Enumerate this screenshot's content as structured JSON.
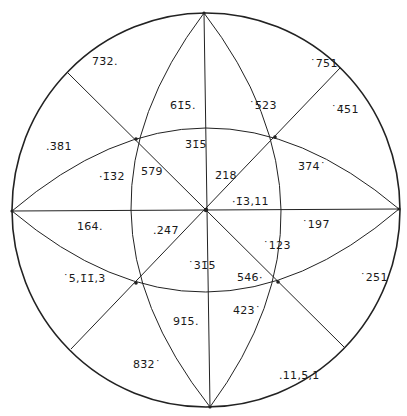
{
  "diagram": {
    "type": "stereographic-projection",
    "colors": {
      "line": "#222222",
      "background": "#ffffff",
      "text": "#1a1a1a"
    },
    "primitive_circle": {
      "cx": 206,
      "cy": 210,
      "r": 196
    },
    "poles": [
      {
        "id": "p732",
        "text": "7̄3̄2.",
        "x": 92,
        "y": 56
      },
      {
        "id": "p751",
        "text": "˙7̄51",
        "x": 310,
        "y": 58
      },
      {
        "id": "p615",
        "text": "6̄1̄5.",
        "x": 170,
        "y": 100
      },
      {
        "id": "p523",
        "text": "˙5̄23",
        "x": 249,
        "y": 100
      },
      {
        "id": "p451",
        "text": "˙4̄51",
        "x": 331,
        "y": 104
      },
      {
        "id": "p381",
        "text": ".3̄8̄1",
        "x": 46,
        "y": 141
      },
      {
        "id": "p315u",
        "text": "3̄1̄5",
        "x": 185,
        "y": 139
      },
      {
        "id": "p132",
        "text": "·1̄3̄2",
        "x": 99,
        "y": 171
      },
      {
        "id": "p579",
        "text": "5̄7̄9",
        "x": 141,
        "y": 166
      },
      {
        "id": "p218",
        "text": "2̄18",
        "x": 215,
        "y": 170
      },
      {
        "id": "p374",
        "text": "3̄74˙",
        "x": 298,
        "y": 161
      },
      {
        "id": "p1311",
        "text": "·1̄3,11",
        "x": 232,
        "y": 196
      },
      {
        "id": "p164",
        "text": "16̄4.",
        "x": 77,
        "y": 221
      },
      {
        "id": "p247",
        "text": ".24̄7",
        "x": 153,
        "y": 225
      },
      {
        "id": "p197",
        "text": "˙197",
        "x": 302,
        "y": 219
      },
      {
        "id": "p123",
        "text": "˙123",
        "x": 263,
        "y": 240
      },
      {
        "id": "p315l",
        "text": "˙31̄5",
        "x": 188,
        "y": 260
      },
      {
        "id": "p546",
        "text": "546·",
        "x": 237,
        "y": 272
      },
      {
        "id": "p5113",
        "text": "˙5,1̄1̄,3",
        "x": 63,
        "y": 273
      },
      {
        "id": "p251",
        "text": "˙251",
        "x": 360,
        "y": 272
      },
      {
        "id": "p423",
        "text": "423˙",
        "x": 233,
        "y": 305
      },
      {
        "id": "p915",
        "text": "91̄5.",
        "x": 173,
        "y": 316
      },
      {
        "id": "p832",
        "text": "83̄2˙",
        "x": 133,
        "y": 359
      },
      {
        "id": "p1151",
        "text": ".11,5,1",
        "x": 279,
        "y": 370
      }
    ]
  }
}
